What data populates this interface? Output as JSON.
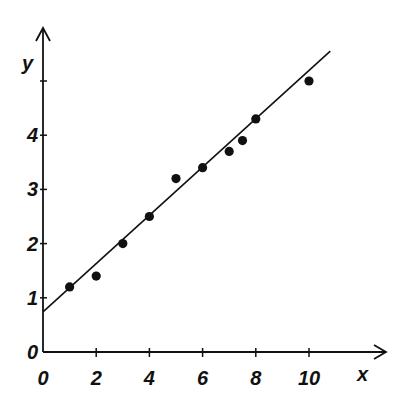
{
  "chart_data": {
    "type": "scatter",
    "title": "",
    "xlabel": "x",
    "ylabel": "y",
    "xlim": [
      0,
      12.9
    ],
    "ylim": [
      0,
      6.0
    ],
    "x_ticks": [
      0,
      2,
      4,
      6,
      8,
      10
    ],
    "x_tick_labels": [
      "0",
      "2",
      "4",
      "6",
      "8",
      "10"
    ],
    "y_ticks": [
      0,
      1,
      2,
      3,
      4,
      5
    ],
    "y_tick_labels": [
      "0",
      "1",
      "2",
      "3",
      "4",
      ""
    ],
    "grid": false,
    "legend": null,
    "series": [
      {
        "name": "data points",
        "type": "scatter",
        "x": [
          1,
          2,
          3,
          4,
          5,
          6,
          7,
          7.5,
          8,
          10
        ],
        "y": [
          1.2,
          1.4,
          2.0,
          2.5,
          3.2,
          3.4,
          3.7,
          3.9,
          4.3,
          5.0
        ]
      },
      {
        "name": "best-fit line",
        "type": "line",
        "x": [
          0,
          10.8
        ],
        "y": [
          0.74,
          5.55
        ]
      }
    ]
  },
  "colors": {
    "ink": "#111111",
    "background": "#ffffff"
  }
}
